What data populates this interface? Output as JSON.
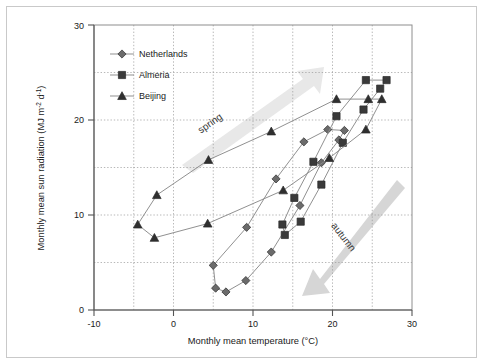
{
  "figure": {
    "background": "#ffffff",
    "frame_color": "#c9c9c9"
  },
  "chart_data": {
    "type": "line",
    "title": "",
    "xlabel": "Monthly mean temperature (°C)",
    "ylabel": "Monthly mean sun radiation (MJ m-2 d-1)",
    "ylabel_parts": {
      "base1": "Monthly mean sun radiation (MJ m",
      "sup1": "-2",
      "base2": " d",
      "sup2": "-1",
      "base3": ")"
    },
    "xlabel_parts": {
      "base": "Monthly mean temperature (°C)"
    },
    "xlim": [
      -10,
      30
    ],
    "ylim": [
      0,
      30
    ],
    "xticks": [
      -10,
      0,
      10,
      20,
      30
    ],
    "yticks": [
      0,
      10,
      20,
      30
    ],
    "x_minor_gridlines": [
      -5,
      5,
      15,
      25
    ],
    "y_minor_gridlines": [
      5,
      15,
      25
    ],
    "grid": true,
    "grid_style": "dotted",
    "grid_color": "#9a9a9a",
    "legend_position": "top-left",
    "marker_fill": "#6b6b6b",
    "marker_edge": "#2b2b2b",
    "line_color": "#8a8a8a",
    "series": [
      {
        "name": "Netherlands",
        "marker": "diamond",
        "color": "#6b6b6b",
        "points": [
          {
            "x": 5.0,
            "y": 4.7
          },
          {
            "x": 5.3,
            "y": 2.3
          },
          {
            "x": 6.6,
            "y": 1.9
          },
          {
            "x": 9.1,
            "y": 3.1
          },
          {
            "x": 12.3,
            "y": 6.1
          },
          {
            "x": 15.9,
            "y": 11.0
          },
          {
            "x": 18.6,
            "y": 15.5
          },
          {
            "x": 20.8,
            "y": 17.9
          },
          {
            "x": 21.5,
            "y": 18.9
          },
          {
            "x": 19.4,
            "y": 19.0
          },
          {
            "x": 16.4,
            "y": 17.7
          },
          {
            "x": 12.9,
            "y": 13.8
          },
          {
            "x": 9.2,
            "y": 8.7
          },
          {
            "x": 5.0,
            "y": 4.7
          }
        ]
      },
      {
        "name": "Almeria",
        "marker": "square",
        "color": "#3a3a3a",
        "points": [
          {
            "x": 13.7,
            "y": 9.0
          },
          {
            "x": 14.0,
            "y": 7.9
          },
          {
            "x": 16.0,
            "y": 9.3
          },
          {
            "x": 18.6,
            "y": 13.2
          },
          {
            "x": 21.3,
            "y": 17.6
          },
          {
            "x": 23.9,
            "y": 21.1
          },
          {
            "x": 26.0,
            "y": 23.3
          },
          {
            "x": 26.8,
            "y": 24.2
          },
          {
            "x": 24.2,
            "y": 24.2
          },
          {
            "x": 20.5,
            "y": 20.4
          },
          {
            "x": 17.6,
            "y": 15.6
          },
          {
            "x": 15.2,
            "y": 11.8
          },
          {
            "x": 13.7,
            "y": 9.0
          }
        ]
      },
      {
        "name": "Beijing",
        "marker": "triangle",
        "color": "#2f2f2f",
        "points": [
          {
            "x": -4.5,
            "y": 9.0
          },
          {
            "x": -2.4,
            "y": 7.6
          },
          {
            "x": 4.3,
            "y": 9.1
          },
          {
            "x": 13.8,
            "y": 12.6
          },
          {
            "x": 19.6,
            "y": 16.0
          },
          {
            "x": 24.2,
            "y": 19.0
          },
          {
            "x": 26.2,
            "y": 22.2
          },
          {
            "x": 24.5,
            "y": 22.2
          },
          {
            "x": 20.5,
            "y": 22.2
          },
          {
            "x": 12.3,
            "y": 18.8
          },
          {
            "x": 4.4,
            "y": 15.8
          },
          {
            "x": -2.1,
            "y": 12.1
          },
          {
            "x": -4.5,
            "y": 9.0
          }
        ]
      }
    ],
    "annotations": [
      {
        "name": "spring-arrow",
        "label": "spring",
        "direction": "up-right",
        "color": "#e2e2e2"
      },
      {
        "name": "autumn-arrow",
        "label": "autumn",
        "direction": "down-left",
        "color": "#d2d2d2"
      }
    ]
  }
}
